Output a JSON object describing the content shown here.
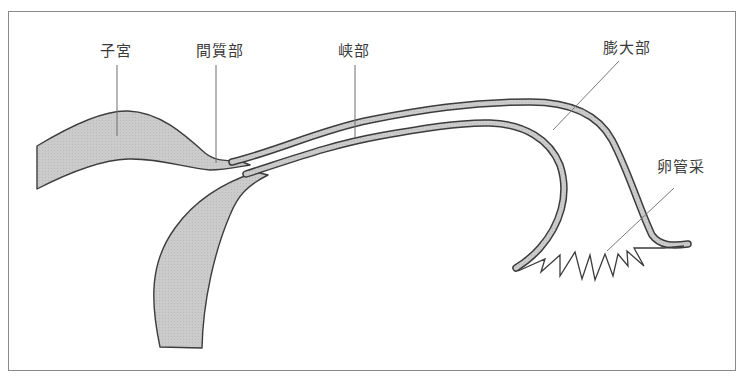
{
  "diagram": {
    "type": "anatomical-diagram",
    "colors": {
      "fill": "#c9c9c9",
      "outline": "#3c3c3c",
      "leader_line": "#7a7a7a",
      "frame": "#8a8a8a",
      "text": "#3a3a3a"
    },
    "labels": [
      {
        "id": "uterus",
        "text": "子宮"
      },
      {
        "id": "interstitial",
        "text": "間質部"
      },
      {
        "id": "isthmus",
        "text": "峡部"
      },
      {
        "id": "ampulla",
        "text": "膨大部"
      },
      {
        "id": "fimbriae",
        "text": "卵管采"
      }
    ]
  }
}
